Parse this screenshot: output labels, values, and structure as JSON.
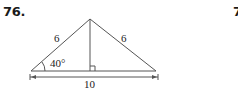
{
  "problem": {
    "number": "76.",
    "next_number_partial": "7"
  },
  "diagram": {
    "type": "isosceles triangle with altitude",
    "left_side_label": "6",
    "right_side_label": "6",
    "base_label": "10",
    "angle_label": "40°",
    "right_angle_marker": true,
    "stroke_color": "#555555"
  }
}
